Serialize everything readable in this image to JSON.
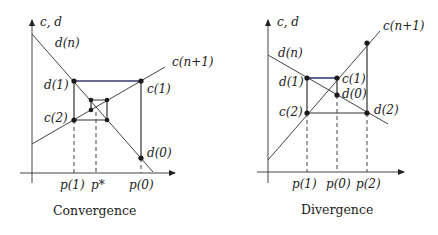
{
  "diagrams": [
    {
      "caption": "Convergence",
      "y_axis_label": "c, d",
      "labels": {
        "demand": "d(n)",
        "supply": "c(n+1)",
        "d1": "d(1)",
        "c1": "c(1)",
        "c2": "c(2)",
        "d0": "d(0)"
      },
      "x_ticks": [
        "p(1)",
        "p*",
        "p(0)"
      ]
    },
    {
      "caption": "Divergence",
      "y_axis_label": "c, d",
      "labels": {
        "demand": "d(n)",
        "supply": "c(n+1)",
        "d1": "d(1)",
        "c1": "c(1)",
        "d0": "d(0)",
        "c2": "c(2)",
        "d2": "d(2)"
      },
      "x_ticks": [
        "p(1)",
        "p(0)",
        "p(2)"
      ]
    }
  ]
}
